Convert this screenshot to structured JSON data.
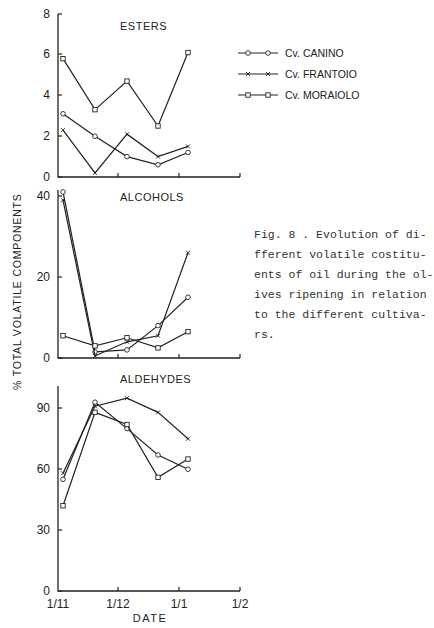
{
  "figure": {
    "caption": "Fig. 8 . Evolution of di-\nfferent volatile costitu-\nents of oil during the ol-\nives ripening in relation\nto the different cultiva-\nrs.",
    "ylabel": "% TOTAL VOLATILE COMPONENTS",
    "xlabel": "DATE",
    "x_tick_labels": [
      "1/11",
      "1/12",
      "1/1",
      "1/2"
    ]
  },
  "legend": [
    {
      "label": "Cv. CANINO",
      "marker": "circle"
    },
    {
      "label": "Cv. FRANTOIO",
      "marker": "x"
    },
    {
      "label": "Cv. MORAIOLO",
      "marker": "square"
    }
  ],
  "chart_data": [
    {
      "type": "line",
      "title": "ESTERS",
      "xlabel": "DATE",
      "ylabel": "% TOTAL VOLATILE COMPONENTS",
      "x": [
        "~3/11",
        "~19/11",
        "~5/12",
        "~20/12",
        "~4/1"
      ],
      "x_ticks": [
        "1/11",
        "1/12",
        "1/1",
        "1/2"
      ],
      "ylim": [
        0,
        8
      ],
      "y_ticks": [
        0,
        2,
        4,
        6,
        8
      ],
      "grid": false,
      "series": [
        {
          "name": "Cv. CANINO",
          "marker": "circle",
          "values": [
            3.1,
            2.0,
            1.0,
            0.6,
            1.2
          ]
        },
        {
          "name": "Cv. FRANTOIO",
          "marker": "x",
          "values": [
            2.3,
            0.2,
            2.1,
            1.0,
            1.5
          ]
        },
        {
          "name": "Cv. MORAIOLO",
          "marker": "square",
          "values": [
            5.8,
            3.3,
            4.7,
            2.5,
            6.1
          ]
        }
      ],
      "legend_position": "right"
    },
    {
      "type": "line",
      "title": "ALCOHOLS",
      "xlabel": "DATE",
      "ylabel": "% TOTAL VOLATILE COMPONENTS",
      "x": [
        "~3/11",
        "~19/11",
        "~5/12",
        "~20/12",
        "~4/1"
      ],
      "x_ticks": [
        "1/11",
        "1/12",
        "1/1",
        "1/2"
      ],
      "ylim": [
        0,
        40
      ],
      "y_ticks": [
        0,
        20,
        40
      ],
      "grid": false,
      "series": [
        {
          "name": "Cv. CANINO",
          "marker": "circle",
          "values": [
            41,
            1.5,
            2,
            8,
            15
          ]
        },
        {
          "name": "Cv. FRANTOIO",
          "marker": "x",
          "values": [
            39,
            0.5,
            4,
            5.5,
            26
          ]
        },
        {
          "name": "Cv. MORAIOLO",
          "marker": "square",
          "values": [
            5.5,
            3,
            5,
            2.5,
            6.5
          ]
        }
      ]
    },
    {
      "type": "line",
      "title": "ALDEHYDES",
      "xlabel": "DATE",
      "ylabel": "% TOTAL VOLATILE COMPONENTS",
      "x": [
        "~3/11",
        "~19/11",
        "~5/12",
        "~20/12",
        "~4/1"
      ],
      "x_ticks": [
        "1/11",
        "1/12",
        "1/1",
        "1/2"
      ],
      "ylim": [
        0,
        100
      ],
      "y_ticks": [
        0,
        30,
        60,
        90
      ],
      "grid": false,
      "series": [
        {
          "name": "Cv. CANINO",
          "marker": "circle",
          "values": [
            55,
            93,
            80,
            67,
            60
          ]
        },
        {
          "name": "Cv. FRANTOIO",
          "marker": "x",
          "values": [
            58,
            91,
            95,
            88,
            75
          ]
        },
        {
          "name": "Cv. MORAIOLO",
          "marker": "square",
          "values": [
            42,
            88,
            82,
            56,
            65
          ]
        }
      ]
    }
  ],
  "layout": {
    "x_pixels": [
      63,
      95,
      127,
      158,
      188
    ],
    "panels": [
      {
        "y0": 177,
        "pxPerUnit": 20.4,
        "yTickPx": [
          177,
          136,
          95,
          54,
          14
        ],
        "axisTop": 14,
        "titleY": 30,
        "titleX": 120
      },
      {
        "y0": 358,
        "pxPerUnit": 4.05,
        "yTickPx": [
          358,
          277,
          196
        ],
        "axisTop": 190,
        "titleY": 201,
        "titleX": 120
      },
      {
        "y0": 591,
        "pxPerUnit": 2.03,
        "yTickPx": [
          591,
          530,
          469,
          408
        ],
        "axisTop": 386,
        "titleY": 383,
        "titleX": 120
      }
    ]
  }
}
